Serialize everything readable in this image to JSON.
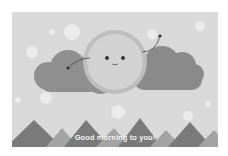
{
  "illustration": {
    "caption": "Good morning to you!",
    "colors": {
      "sky": "#d9d9d9",
      "sun": "#cfcfcf",
      "sun_ray": "#bdbdbd",
      "cloud_left": "#8f8f8f",
      "cloud_right": "#8a8a8a",
      "mountain_dark": "#7a7a7a",
      "mountain_light": "#a3a3a3",
      "sparkle": "#efefef"
    }
  }
}
